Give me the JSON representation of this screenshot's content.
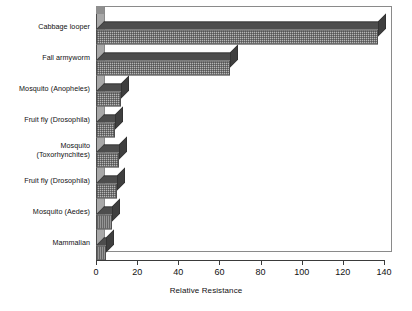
{
  "chart_data": {
    "type": "bar",
    "orientation": "horizontal",
    "style": "3d",
    "title": "",
    "xlabel": "Relative Resistance",
    "ylabel": "",
    "xlim": [
      0,
      140
    ],
    "xticks": [
      0,
      20,
      40,
      60,
      80,
      100,
      120,
      140
    ],
    "grid": false,
    "legend": null,
    "categories": [
      "Cabbage looper",
      "Fall armyworm",
      "Mosquito (Anopheles)",
      "Fruit fly (Drosophila)",
      "Mosquito\n(Toxorhynchites)",
      "Fruit fly (Drosophila)",
      "Mosquito (Aedes)",
      "Mammalian"
    ],
    "values": [
      137,
      65,
      12,
      9,
      11,
      10,
      8,
      5
    ],
    "bar_fill_color": "#b6b6b6",
    "bar_edge_color": "#4f4f4f",
    "bar_top_color": "#4d4d4d",
    "bar_side_color": "#3f3f3f"
  },
  "axis": {
    "x_title": "Relative Resistance",
    "tick_labels": [
      "0",
      "20",
      "40",
      "60",
      "80",
      "100",
      "120",
      "140"
    ]
  }
}
